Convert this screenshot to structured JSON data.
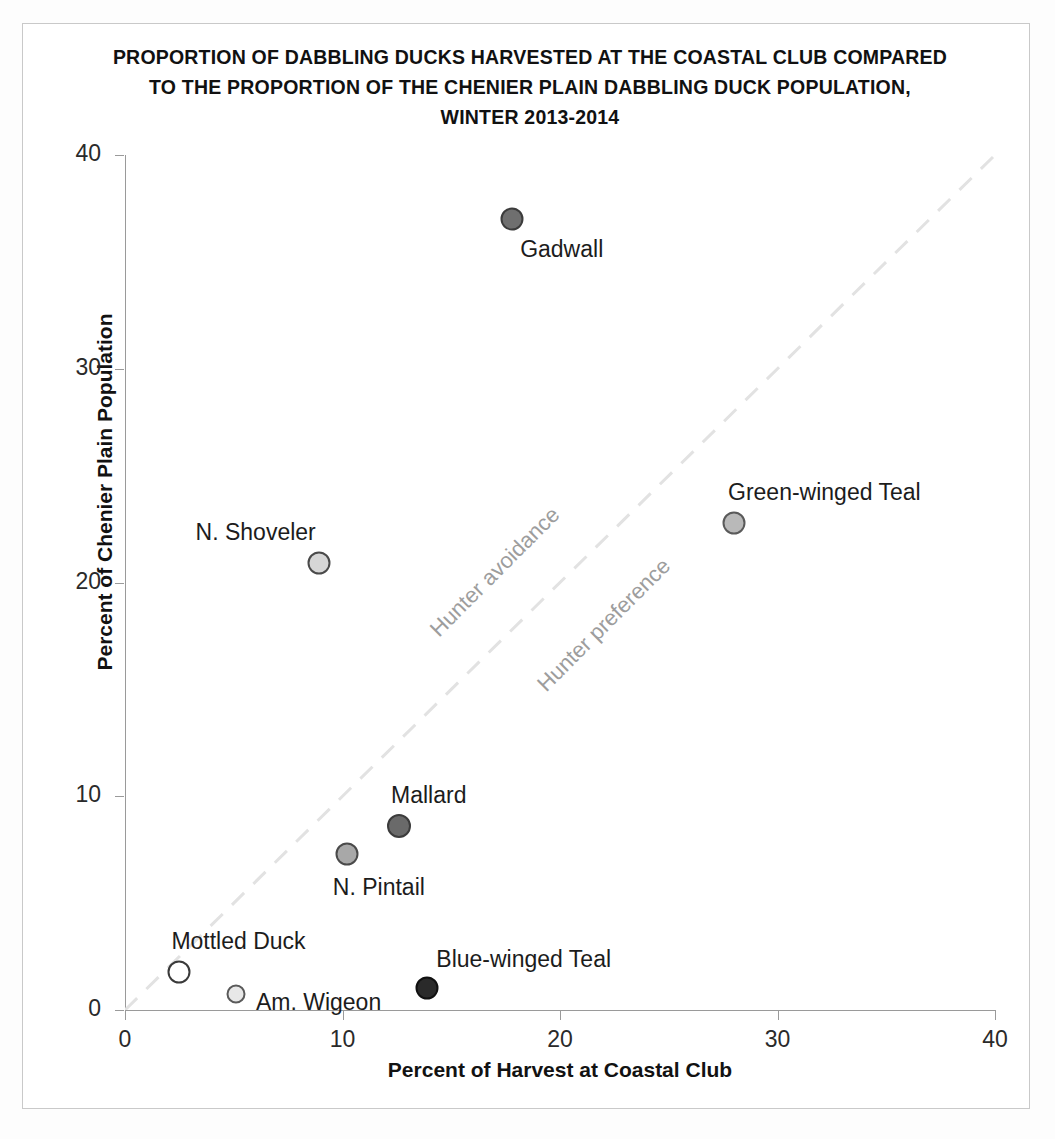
{
  "chart_data": {
    "type": "scatter",
    "title": "PROPORTION OF DABBLING DUCKS HARVESTED AT THE COASTAL CLUB COMPARED TO THE PROPORTION OF THE CHENIER PLAIN DABBLING DUCK POPULATION, WINTER 2013-2014",
    "title_lines": [
      "PROPORTION  OF DABBLING DUCKS HARVESTED AT THE COASTAL CLUB COMPARED",
      "TO THE PROPORTION  OF THE CHENIER PLAIN DABBLING DUCK POPULATION,",
      "WINTER 2013-2014"
    ],
    "xlabel": "Percent of Harvest at Coastal Club",
    "ylabel": "Percent of Chenier Plain Population",
    "xlim": [
      0,
      40
    ],
    "ylim": [
      0,
      40
    ],
    "xticks": [
      "0",
      "10",
      "20",
      "30",
      "40"
    ],
    "yticks": [
      "0",
      "10",
      "20",
      "30",
      "40"
    ],
    "grid": false,
    "legend": "none",
    "reference_line": {
      "label": "1:1 line",
      "style": "dashed",
      "color": "#e2e2e2",
      "from": [
        0,
        0
      ],
      "to": [
        40,
        40
      ]
    },
    "annotations": [
      {
        "text": "Hunter avoidance",
        "x": 17.0,
        "y": 20.5,
        "rotation": -45,
        "color": "#9d9d9d"
      },
      {
        "text": "Hunter preference",
        "x": 22.0,
        "y": 18.0,
        "rotation": -45,
        "color": "#9d9d9d"
      }
    ],
    "points": [
      {
        "name": "Gadwall",
        "x": 17.8,
        "y": 37.0,
        "fill": "#6f6f6f",
        "stroke": "#3c3c3c",
        "size": 23,
        "label_dx": 8,
        "label_dy": 17,
        "label_anchor": "start"
      },
      {
        "name": "Green-winged Teal",
        "x": 28.0,
        "y": 22.8,
        "fill": "#b9b9b9",
        "stroke": "#5a5a5a",
        "size": 23,
        "label_dx": -6,
        "label_dy": -44,
        "label_anchor": "start"
      },
      {
        "name": "N. Shoveler",
        "x": 8.9,
        "y": 20.9,
        "fill": "#d6d6d6",
        "stroke": "#4a4a4a",
        "size": 23,
        "label_dx": -123,
        "label_dy": -44,
        "label_anchor": "start"
      },
      {
        "name": "Mallard",
        "x": 12.6,
        "y": 8.6,
        "fill": "#6a6a6a",
        "stroke": "#3c3c3c",
        "size": 24,
        "label_dx": -8,
        "label_dy": -44,
        "label_anchor": "start"
      },
      {
        "name": "N. Pintail",
        "x": 10.2,
        "y": 7.3,
        "fill": "#a8a8a8",
        "stroke": "#4a4a4a",
        "size": 23,
        "label_dx": -14,
        "label_dy": 20,
        "label_anchor": "start"
      },
      {
        "name": "Mottled Duck",
        "x": 2.5,
        "y": 1.8,
        "fill": "#ffffff",
        "stroke": "#3a3a3a",
        "size": 23,
        "label_dx": -8,
        "label_dy": -44,
        "label_anchor": "start"
      },
      {
        "name": "Am. Wigeon",
        "x": 5.1,
        "y": 0.75,
        "fill": "#e8e8e8",
        "stroke": "#5a5a5a",
        "size": 19,
        "label_dx": 20,
        "label_dy": -5,
        "label_anchor": "start"
      },
      {
        "name": "Blue-winged Teal",
        "x": 13.9,
        "y": 1.05,
        "fill": "#2a2a2a",
        "stroke": "#111111",
        "size": 23,
        "label_dx": 9,
        "label_dy": -42,
        "label_anchor": "start"
      }
    ]
  }
}
